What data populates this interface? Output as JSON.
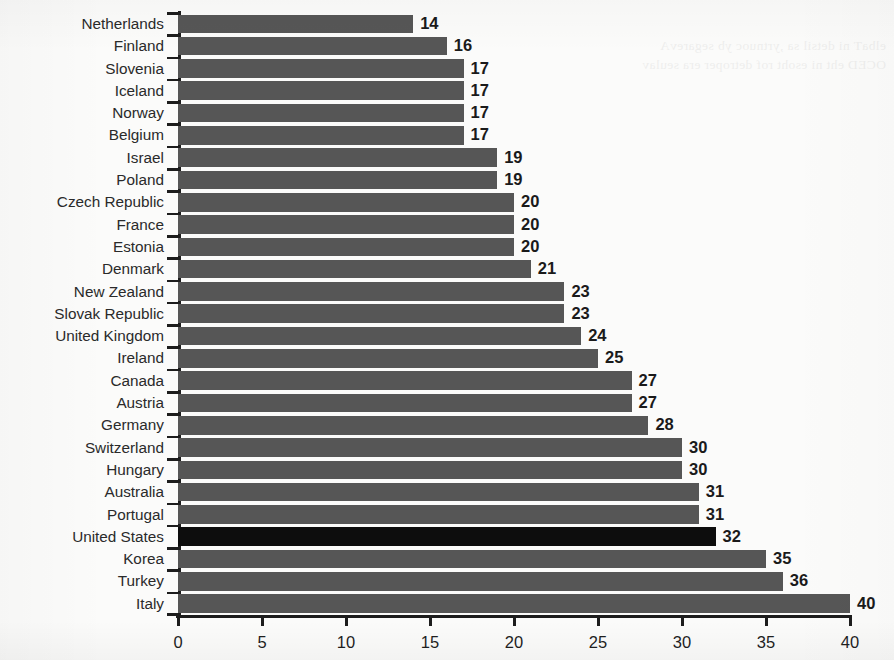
{
  "chart_data": {
    "type": "bar",
    "orientation": "horizontal",
    "title": "",
    "subtitle": "",
    "xlabel": "",
    "ylabel": "",
    "xlim": [
      0,
      40
    ],
    "xticks": [
      "0",
      "5",
      "10",
      "15",
      "20",
      "25",
      "30",
      "35",
      "40"
    ],
    "xtick_step": 5,
    "grid": false,
    "legend": "none",
    "highlight_category": "United States",
    "colors": {
      "bar": "#565656",
      "bar_highlight": "#0d0d0d",
      "axis": "#1d1d1d",
      "background": "#fbfbfa",
      "label_text": "#2a2a2a",
      "value_text": "#1a1a1a"
    },
    "categories": [
      "Netherlands",
      "Finland",
      "Slovenia",
      "Iceland",
      "Norway",
      "Belgium",
      "Israel",
      "Poland",
      "Czech Republic",
      "France",
      "Estonia",
      "Denmark",
      "New Zealand",
      "Slovak Republic",
      "United Kingdom",
      "Ireland",
      "Canada",
      "Austria",
      "Germany",
      "Switzerland",
      "Hungary",
      "Australia",
      "Portugal",
      "United States",
      "Korea",
      "Turkey",
      "Italy"
    ],
    "values": [
      14,
      16,
      17,
      17,
      17,
      17,
      19,
      19,
      20,
      20,
      20,
      21,
      23,
      23,
      24,
      25,
      27,
      27,
      28,
      30,
      30,
      31,
      31,
      32,
      35,
      36,
      40
    ],
    "data_labels": [
      "14",
      "16",
      "17",
      "17",
      "17",
      "17",
      "19",
      "19",
      "20",
      "20",
      "20",
      "21",
      "23",
      "23",
      "24",
      "25",
      "27",
      "27",
      "28",
      "30",
      "30",
      "31",
      "31",
      "32",
      "35",
      "36",
      "40"
    ]
  },
  "artifacts": {
    "bleed_through_text": "scanned page show-through, illegible"
  }
}
